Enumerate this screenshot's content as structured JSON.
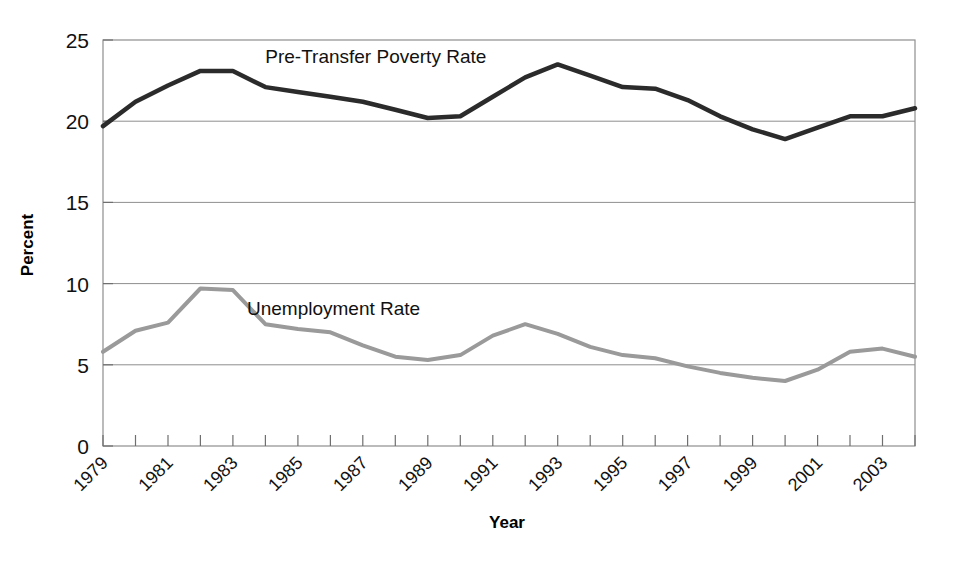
{
  "chart_data": {
    "type": "line",
    "title": "",
    "xlabel": "Year",
    "ylabel": "Percent",
    "xlim": [
      1979,
      2004
    ],
    "ylim": [
      0,
      25
    ],
    "yticks": [
      0,
      5,
      10,
      15,
      20,
      25
    ],
    "ytick_labels": [
      "0",
      "5",
      "10",
      "15",
      "20",
      "25"
    ],
    "grid": "horizontal",
    "legend": "inline-annotations",
    "x": [
      1979,
      1980,
      1981,
      1982,
      1983,
      1984,
      1985,
      1986,
      1987,
      1988,
      1989,
      1990,
      1991,
      1992,
      1993,
      1994,
      1995,
      1996,
      1997,
      1998,
      1999,
      2000,
      2001,
      2002,
      2003,
      2004
    ],
    "xtick_labels": [
      "1979",
      "",
      "1981",
      "",
      "1983",
      "",
      "1985",
      "",
      "1987",
      "",
      "1989",
      "",
      "1991",
      "",
      "1993",
      "",
      "1995",
      "",
      "1997",
      "",
      "1999",
      "",
      "2001",
      "",
      "2003",
      ""
    ],
    "series": [
      {
        "name": "Pre-Transfer Poverty Rate",
        "color": "#2b2b2b",
        "width": 4.5,
        "label_x": 1987.4,
        "label_y": 23.6,
        "values": [
          19.7,
          21.2,
          22.2,
          23.1,
          23.1,
          22.1,
          21.8,
          21.5,
          21.2,
          20.7,
          20.2,
          20.3,
          21.5,
          22.7,
          23.5,
          22.8,
          22.1,
          22.0,
          21.3,
          20.3,
          19.5,
          18.9,
          19.6,
          20.3,
          20.3,
          20.8
        ]
      },
      {
        "name": "Unemployment Rate",
        "color": "#9a9a9a",
        "width": 4.0,
        "label_x": 1986.1,
        "label_y": 8.1,
        "values": [
          5.8,
          7.1,
          7.6,
          9.7,
          9.6,
          7.5,
          7.2,
          7.0,
          6.2,
          5.5,
          5.3,
          5.6,
          6.8,
          7.5,
          6.9,
          6.1,
          5.6,
          5.4,
          4.9,
          4.5,
          4.2,
          4.0,
          4.7,
          5.8,
          6.0,
          5.5
        ]
      }
    ]
  }
}
